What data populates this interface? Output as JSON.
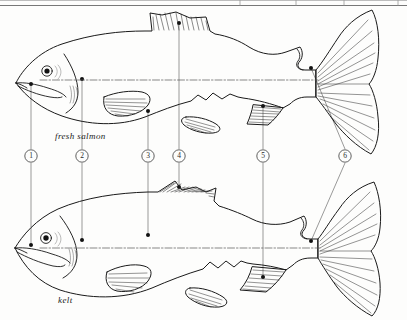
{
  "figure": {
    "kind": "line-drawing",
    "background_color": "#fdfdfc",
    "ink_color": "#1a1a1a",
    "callout_color": "#6e6e6e",
    "top_rule": {
      "present": true,
      "y": 5
    }
  },
  "specimens": [
    {
      "id": "fresh-salmon",
      "label": "fresh salmon",
      "label_x": 55,
      "label_y": 131,
      "description": "plump deep-bodied salmon in prime condition",
      "lateral_line": true
    },
    {
      "id": "kelt",
      "label": "kelt",
      "label_x": 58,
      "label_y": 295,
      "description": "spent thin salmon after spawning with eroded fins",
      "lateral_line": true
    }
  ],
  "callouts": [
    {
      "number": "1",
      "circle_x": 31,
      "circle_y": 156,
      "top_point_x": 31,
      "top_point_y": 84,
      "bottom_point_x": 31,
      "bottom_point_y": 245,
      "part": "snout-jaw"
    },
    {
      "number": "2",
      "circle_x": 82,
      "circle_y": 156,
      "top_point_x": 82,
      "top_point_y": 79,
      "bottom_point_x": 82,
      "bottom_point_y": 240,
      "part": "gill-cover"
    },
    {
      "number": "3",
      "circle_x": 148,
      "circle_y": 156,
      "top_point_x": 148,
      "top_point_y": 111,
      "bottom_point_x": 148,
      "bottom_point_y": 235,
      "part": "pectoral-fin"
    },
    {
      "number": "4",
      "circle_x": 179,
      "circle_y": 156,
      "top_point_x": 179,
      "top_point_y": 23,
      "bottom_point_x": 179,
      "bottom_point_y": 187,
      "part": "dorsal-fin"
    },
    {
      "number": "5",
      "circle_x": 263,
      "circle_y": 156,
      "top_point_x": 263,
      "top_point_y": 106,
      "bottom_point_x": 263,
      "bottom_point_y": 277,
      "part": "anal-fin"
    },
    {
      "number": "6",
      "circle_x": 345,
      "circle_y": 156,
      "top_point_x": 311,
      "top_point_y": 68,
      "bottom_point_x": 311,
      "bottom_point_y": 241,
      "part": "caudal-peduncle"
    }
  ]
}
